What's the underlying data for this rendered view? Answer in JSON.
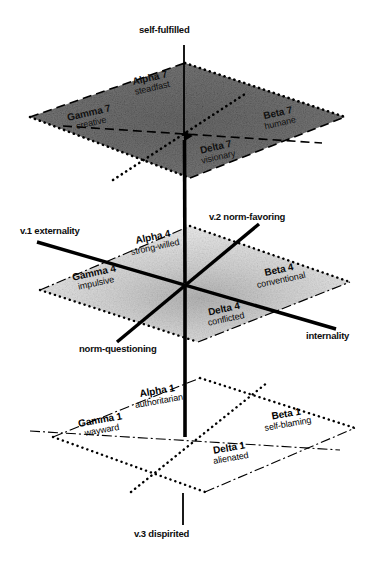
{
  "figure": {
    "colors": {
      "line": "#000000",
      "top_plane_fill": "#6e6e6e",
      "mid_plane_fill": "#d9d9d9",
      "bottom_plane_fill": "#ffffff"
    }
  },
  "axes": {
    "vertical_top_label": "self-fulfilled",
    "vertical_bottom_label": "v.3 dispirited",
    "left_label": "v.1 externality",
    "right_label": "internality",
    "upper_right_label": "v.2 norm-favoring",
    "lower_left_label": "norm-questioning"
  },
  "planes": [
    {
      "id": "top",
      "level": 7,
      "fill": "dark-gray",
      "cells": [
        {
          "name": "Alpha 7",
          "trait": "steadfast",
          "quadrant": "back-left"
        },
        {
          "name": "Beta 7",
          "trait": "humane",
          "quadrant": "back-right"
        },
        {
          "name": "Gamma 7",
          "trait": "creative",
          "quadrant": "front-left"
        },
        {
          "name": "Delta 7",
          "trait": "visionary",
          "quadrant": "front-right"
        }
      ]
    },
    {
      "id": "middle",
      "level": 4,
      "fill": "light-gray",
      "cells": [
        {
          "name": "Alpha 4",
          "trait": "strong-willed",
          "quadrant": "back-left"
        },
        {
          "name": "Beta 4",
          "trait": "conventional",
          "quadrant": "back-right"
        },
        {
          "name": "Gamma 4",
          "trait": "impulsive",
          "quadrant": "front-left"
        },
        {
          "name": "Delta 4",
          "trait": "conflicted",
          "quadrant": "front-right"
        }
      ]
    },
    {
      "id": "bottom",
      "level": 1,
      "fill": "white",
      "cells": [
        {
          "name": "Alpha 1",
          "trait": "authoritarian",
          "quadrant": "back-left"
        },
        {
          "name": "Beta 1",
          "trait": "self-blaming",
          "quadrant": "back-right"
        },
        {
          "name": "Gamma 1",
          "trait": "wayward",
          "quadrant": "front-left"
        },
        {
          "name": "Delta 1",
          "trait": "alienated",
          "quadrant": "front-right"
        }
      ]
    }
  ]
}
